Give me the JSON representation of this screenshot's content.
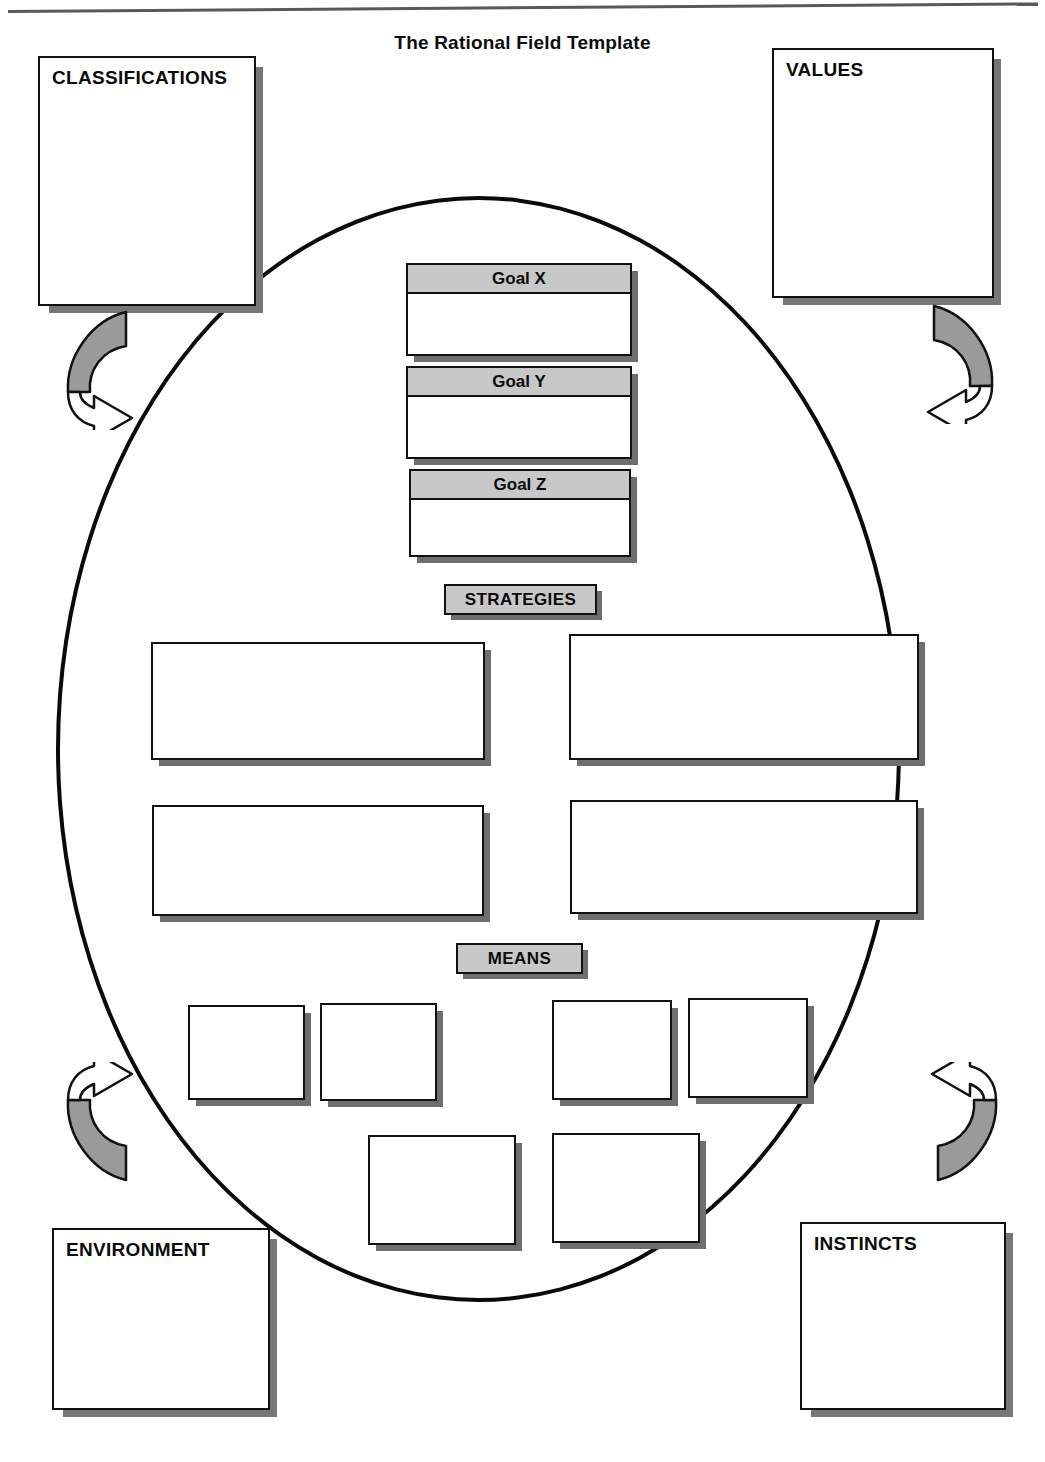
{
  "page": {
    "title": "The Rational Field Template",
    "background_color": "#ffffff",
    "ink_color": "#111111",
    "gray_fill": "#c8c8c8",
    "shadow_color": "#6e6e6e"
  },
  "corner_boxes": [
    {
      "label": "CLASSIFICATIONS",
      "position": "top-left"
    },
    {
      "label": "VALUES",
      "position": "top-right"
    },
    {
      "label": "ENVIRONMENT",
      "position": "bottom-left"
    },
    {
      "label": "INSTINCTS",
      "position": "bottom-right"
    }
  ],
  "field": {
    "shape": "ellipse",
    "goals": [
      {
        "label": "Goal X"
      },
      {
        "label": "Goal Y"
      },
      {
        "label": "Goal Z"
      }
    ],
    "strategies_label": "STRATEGIES",
    "strategy_boxes": [
      {
        "text": ""
      },
      {
        "text": ""
      },
      {
        "text": ""
      },
      {
        "text": ""
      }
    ],
    "means_label": "MEANS",
    "means_boxes_row1": [
      {
        "text": ""
      },
      {
        "text": ""
      },
      {
        "text": ""
      },
      {
        "text": ""
      }
    ],
    "means_boxes_row2": [
      {
        "text": ""
      },
      {
        "text": ""
      }
    ]
  },
  "arrows": [
    {
      "name": "classifications-inflow-arrow",
      "direction": "clockwise-into-field",
      "fill_gray": "#9a9a9a"
    },
    {
      "name": "values-inflow-arrow",
      "direction": "counterclockwise-into-field",
      "fill_gray": "#9a9a9a"
    },
    {
      "name": "environment-inflow-arrow",
      "direction": "counterclockwise-into-field",
      "fill_gray": "#9a9a9a"
    },
    {
      "name": "instincts-inflow-arrow",
      "direction": "clockwise-into-field",
      "fill_gray": "#9a9a9a"
    }
  ]
}
